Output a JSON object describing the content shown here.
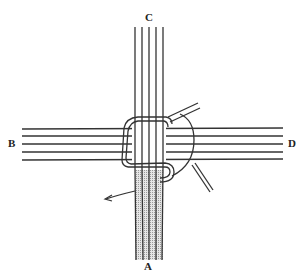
{
  "diagram": {
    "type": "knot-illustration",
    "labels": {
      "top": "C",
      "left": "B",
      "right": "D",
      "bottom": "A"
    },
    "colors": {
      "stroke": "#333333",
      "shaded_strand": "#cfcfcf",
      "background": "#ffffff"
    },
    "strands": {
      "vertical_top_count": 5,
      "horizontal_count": 5,
      "vertical_bottom_shaded_count": 4
    }
  }
}
